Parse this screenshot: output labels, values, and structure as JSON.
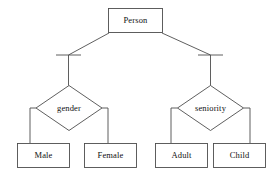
{
  "diagram": {
    "type": "entity-relationship-specialization",
    "stroke_color": "#4d4d4d",
    "text_color": "#101010",
    "background_color": "#ffffff",
    "root": {
      "id": "person",
      "label": "Person",
      "shape": "rectangle",
      "x": 108,
      "y": 8,
      "width": 55,
      "height": 25
    },
    "discriminators": [
      {
        "id": "gender",
        "label": "gender",
        "shape": "diamond",
        "cx": 69,
        "cy": 108,
        "rx": 33,
        "ry": 23
      },
      {
        "id": "seniority",
        "label": "seniority",
        "shape": "diamond",
        "cx": 210,
        "cy": 108,
        "rx": 33,
        "ry": 23
      }
    ],
    "leaves": [
      {
        "id": "male",
        "label": "Male",
        "shape": "rectangle",
        "x": 17,
        "y": 143,
        "width": 53,
        "height": 25,
        "parent": "gender"
      },
      {
        "id": "female",
        "label": "Female",
        "shape": "rectangle",
        "x": 84,
        "y": 143,
        "width": 53,
        "height": 25,
        "parent": "gender"
      },
      {
        "id": "adult",
        "label": "Adult",
        "shape": "rectangle",
        "x": 155,
        "y": 143,
        "width": 53,
        "height": 25,
        "parent": "seniority"
      },
      {
        "id": "child",
        "label": "Child",
        "shape": "rectangle",
        "x": 213,
        "y": 143,
        "width": 53,
        "height": 25,
        "parent": "seniority"
      }
    ],
    "connector_bars": [
      {
        "id": "bar-left",
        "x1": 56,
        "x2": 81,
        "y": 55
      },
      {
        "id": "bar-right",
        "x1": 198,
        "x2": 223,
        "y": 55
      }
    ]
  }
}
